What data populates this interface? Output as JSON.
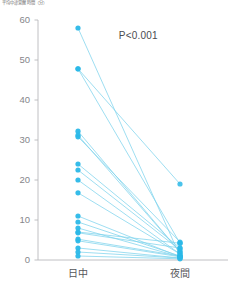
{
  "chart_data": {
    "type": "line",
    "title": "",
    "ylabel": "平均中途覚醒時間（分）",
    "xlabel": "",
    "categories": [
      "日中",
      "夜間"
    ],
    "ylim": [
      0,
      60
    ],
    "yticks": [
      0,
      10,
      20,
      30,
      40,
      50,
      60
    ],
    "ytick_labels": [
      "0",
      "10",
      "20",
      "30",
      "40",
      "50",
      "60"
    ],
    "grid": false,
    "legend": null,
    "annotations": [
      {
        "text": "P<0.001",
        "x": 0.52,
        "y": 56
      }
    ],
    "series": [
      {
        "name": "subject-1",
        "values": [
          58.0,
          1.0
        ]
      },
      {
        "name": "subject-2",
        "values": [
          47.8,
          4.2
        ]
      },
      {
        "name": "subject-3",
        "values": [
          47.8,
          19.0
        ]
      },
      {
        "name": "subject-4",
        "values": [
          32.2,
          2.0
        ]
      },
      {
        "name": "subject-5",
        "values": [
          31.2,
          2.0
        ]
      },
      {
        "name": "subject-6",
        "values": [
          30.8,
          4.5
        ]
      },
      {
        "name": "subject-7",
        "values": [
          24.0,
          3.0
        ]
      },
      {
        "name": "subject-8",
        "values": [
          22.5,
          2.5
        ]
      },
      {
        "name": "subject-9",
        "values": [
          20.0,
          1.5
        ]
      },
      {
        "name": "subject-10",
        "values": [
          16.8,
          1.5
        ]
      },
      {
        "name": "subject-11",
        "values": [
          11.0,
          0.8
        ]
      },
      {
        "name": "subject-12",
        "values": [
          9.5,
          1.0
        ]
      },
      {
        "name": "subject-13",
        "values": [
          8.0,
          0.8
        ]
      },
      {
        "name": "subject-14",
        "values": [
          7.0,
          4.2
        ]
      },
      {
        "name": "subject-15",
        "values": [
          6.8,
          3.0
        ]
      },
      {
        "name": "subject-16",
        "values": [
          5.2,
          1.0
        ]
      },
      {
        "name": "subject-17",
        "values": [
          4.8,
          0.8
        ]
      },
      {
        "name": "subject-18",
        "values": [
          3.0,
          0.5
        ]
      },
      {
        "name": "subject-19",
        "values": [
          2.0,
          0.5
        ]
      },
      {
        "name": "subject-20",
        "values": [
          1.0,
          0.3
        ]
      }
    ],
    "style": {
      "marker_color": "#2BB8E8",
      "line_color": "#7FD4ED",
      "axis_color": "#b9b9bc",
      "marker_radius": 2.6,
      "line_width": 0.9
    }
  },
  "axis": {
    "y_title": "平均中途覚醒時間（分）",
    "x_labels": [
      "日中",
      "夜間"
    ],
    "y_labels": [
      "60",
      "50",
      "40",
      "30",
      "20",
      "10",
      "0"
    ]
  },
  "stats": {
    "p_value_label": "P<0.001"
  }
}
